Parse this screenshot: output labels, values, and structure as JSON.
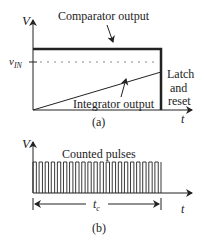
{
  "panel_a": {
    "y_axis_label": "V",
    "x_axis_label": "t",
    "vin_label": "v",
    "vin_subscript": "IN",
    "comparator_label": "Comparator output",
    "integrator_label": "Integrator output",
    "latch_lines": [
      "Latch",
      "and",
      "reset"
    ],
    "caption": "(a)"
  },
  "panel_b": {
    "y_axis_label": "V",
    "x_axis_label": "t",
    "pulses_label": "Counted pulses",
    "interval_label": "t",
    "interval_subscript": "c",
    "pulse_count": 21,
    "caption": "(b)"
  },
  "colors": {
    "ink": "#222222",
    "dotted": "#888888"
  }
}
